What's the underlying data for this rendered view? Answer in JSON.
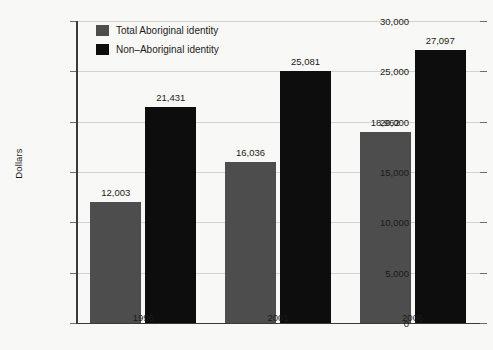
{
  "chart_data": {
    "type": "bar",
    "title": "",
    "xlabel": "",
    "ylabel": "Dollars",
    "ylim": [
      0,
      30000
    ],
    "grid": true,
    "legend_position": "top-left",
    "categories": [
      "1996",
      "2001",
      "2006"
    ],
    "ytick_labels": [
      "0",
      "5,000",
      "10,000",
      "15,000",
      "20,000",
      "25,000",
      "30,000"
    ],
    "ytick_values": [
      0,
      5000,
      10000,
      15000,
      20000,
      25000,
      30000
    ],
    "series": [
      {
        "name": "Total Aboriginal identity",
        "color": "#4d4d4d",
        "values": [
          12003,
          16036,
          18962
        ],
        "value_labels": [
          "12,003",
          "16,036",
          "18,962"
        ]
      },
      {
        "name": "Non–Aboriginal identity",
        "color": "#0d0d0d",
        "values": [
          21431,
          25081,
          27097
        ],
        "value_labels": [
          "21,431",
          "25,081",
          "27,097"
        ]
      }
    ]
  },
  "colors": {
    "background": "#f8f8f6",
    "axis": "#3a3a3a",
    "gridline": "#d2d2ce",
    "text": "#1b1b1b"
  }
}
